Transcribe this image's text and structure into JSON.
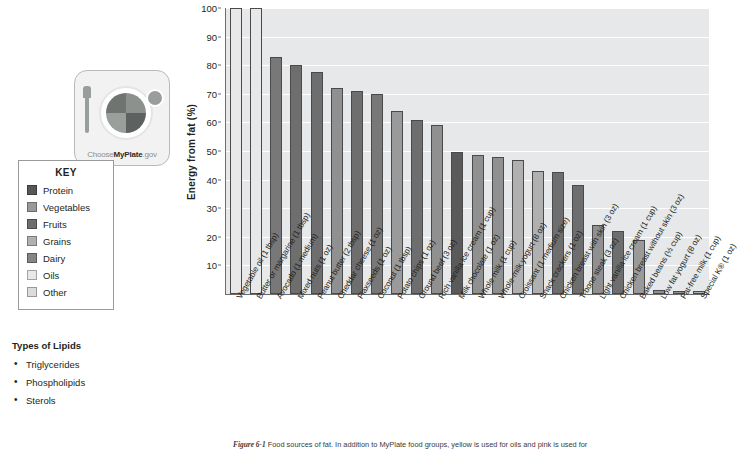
{
  "logo": {
    "name": "myplate-logo",
    "wordmark_pre": "Choose",
    "wordmark_bold": "MyPlate",
    "wordmark_post": ".gov"
  },
  "key": {
    "title": "KEY",
    "items": [
      {
        "label": "Protein",
        "color": "#575757"
      },
      {
        "label": "Vegetables",
        "color": "#9a9a9a"
      },
      {
        "label": "Fruits",
        "color": "#6e6e6e"
      },
      {
        "label": "Grains",
        "color": "#b0b0b0"
      },
      {
        "label": "Dairy",
        "color": "#858585"
      },
      {
        "label": "Oils",
        "color": "#e8e8e8"
      },
      {
        "label": "Other",
        "color": "#dcdcdc"
      }
    ]
  },
  "lipids": {
    "title": "Types of Lipids",
    "items": [
      "Triglycerides",
      "Phospholipids",
      "Sterols"
    ]
  },
  "caption": {
    "figure_number": "Figure 6-1",
    "text": "Food sources of fat. In addition to MyPlate food groups, yellow is used for oils and pink is used for"
  },
  "chart_data": {
    "type": "bar",
    "title": "",
    "xlabel": "",
    "ylabel": "Energy from fat (%)",
    "ylim": [
      0,
      100
    ],
    "yticks": [
      10,
      20,
      30,
      40,
      50,
      60,
      70,
      80,
      90,
      100
    ],
    "grid": true,
    "legend_position": "left-outside",
    "categories": [
      "Vegetable oil (1 tbsp)",
      "Butter or margarine (1 tbsp)",
      "Avocado (1 medium)",
      "Mixed nuts (1 oz)",
      "Peanut butter (2 tbsp)",
      "Cheddar cheese (1 oz)",
      "Flaxseeds (1 oz)",
      "Coconut (1 tbsp)",
      "Potato chips (1 oz)",
      "Ground beef (3 oz)",
      "Rich vanilla ice cream (1 cup)",
      "Milk chocolate (1 oz)",
      "Whole milk (1 cup)",
      "Whole-milk yogurt (8 oz)",
      "Croissant (1 medium size)",
      "Snack crackers (1 oz)",
      "Chicken breast with skin (3 oz)",
      "T-bone steak (3 oz)",
      "Light vanilla ice cream (1 cup)",
      "Chicken breast without skin (3 oz)",
      "Baked beans (½ cup)",
      "Low fat yogurt (8 oz)",
      "Fat-free milk (1 cup)",
      "Special K® (1 oz)"
    ],
    "values": [
      100,
      100,
      83,
      80,
      77.5,
      72,
      71,
      70,
      64,
      61,
      59,
      49.5,
      48.5,
      48,
      47,
      43,
      42.5,
      38,
      24,
      22,
      19,
      1.5,
      1.2,
      1.2
    ],
    "groups": [
      "Oils",
      "Oils",
      "Fruits",
      "Protein",
      "Protein",
      "Dairy",
      "Protein",
      "Fruits",
      "Vegetables",
      "Protein",
      "Dairy",
      "Other",
      "Dairy",
      "Dairy",
      "Grains",
      "Grains",
      "Protein",
      "Protein",
      "Dairy",
      "Protein",
      "Vegetables",
      "Dairy",
      "Dairy",
      "Grains"
    ],
    "group_colors": {
      "Protein": "#6e6e6e",
      "Vegetables": "#9a9a9a",
      "Fruits": "#787878",
      "Grains": "#b0b0b0",
      "Dairy": "#909090",
      "Oils": "#e8e8e8",
      "Other": "#5a5a5a"
    }
  }
}
